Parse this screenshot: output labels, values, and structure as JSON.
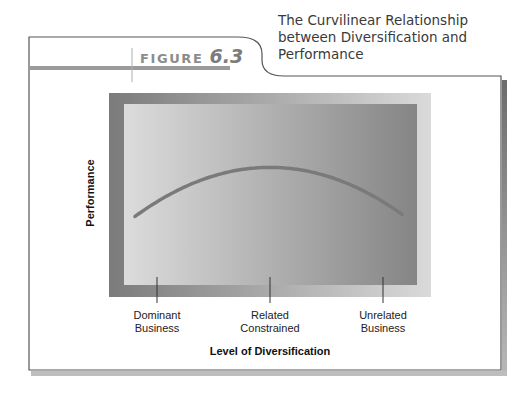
{
  "figure": {
    "label_word": "FIGURE",
    "label_number": "6.3",
    "title_lines": [
      "The Curvilinear Relationship",
      "between Diversification and",
      "Performance"
    ]
  },
  "colors": {
    "frame_stroke": "#555555",
    "shadow": "#8a8a8a",
    "accent_bar": "#9b9b9b",
    "curve": "#7a7a7a",
    "outer_panel_left": "#7b7b7b",
    "outer_panel_right": "#dadada",
    "inner_panel_left": "#dcdcdc",
    "inner_panel_right": "#858585"
  },
  "chart_data": {
    "type": "line",
    "title": "The Curvilinear Relationship between Diversification and Performance",
    "xlabel": "Level of Diversification",
    "ylabel": "Performance",
    "categories": [
      "Dominant Business",
      "Related Constrained",
      "Unrelated Business"
    ],
    "category_lines": [
      [
        "Dominant",
        "Business"
      ],
      [
        "Related",
        "Constrained"
      ],
      [
        "Unrelated",
        "Business"
      ]
    ],
    "series": [
      {
        "name": "Performance",
        "values": [
          0.46,
          0.65,
          0.46
        ]
      }
    ],
    "value_scale": "relative (no numeric y-axis ticks shown)",
    "ylim": [
      0,
      1
    ],
    "grid": false,
    "legend": "none",
    "shape": "inverted-U (curvilinear)"
  }
}
